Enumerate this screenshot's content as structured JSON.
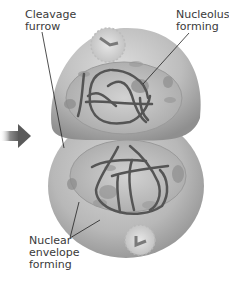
{
  "figure": {
    "labels": {
      "cleavage_furrow": "Cleavage\nfurrow",
      "nucleolus_forming": "Nucleolus\nforming",
      "nuclear_envelope_forming": "Nuclear\nenvelope\nforming"
    },
    "arrow": "arrow-right-icon",
    "colors": {
      "cell_fill": "#b4b4b4",
      "cell_highlight": "#d8d8d8",
      "nucleus_fill": "#bdbdbd",
      "chromosome": "#555555",
      "label_text": "#3a3a3a",
      "leader_line": "#222222",
      "arrow": "#5a5a5a"
    }
  }
}
